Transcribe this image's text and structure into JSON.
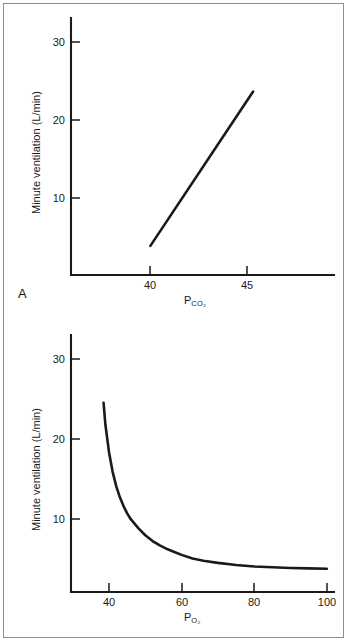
{
  "figure": {
    "background_color": "#ffffff",
    "border_color": "#8d8d8d",
    "ink_color": "#1a1a1a"
  },
  "panels": [
    {
      "letter": "A",
      "ylabel": "Minute ventilation (L/min)",
      "xlabel_main": "P",
      "xlabel_sub": "CO2",
      "xlabel_sub_display": "CO₂"
    },
    {
      "letter": "B",
      "ylabel": "Minute ventilation (L/min)",
      "xlabel_main": "P",
      "xlabel_sub": "O2",
      "xlabel_sub_display": "O₂"
    }
  ],
  "chart_data": [
    {
      "type": "line",
      "title": "",
      "panel": "A",
      "xlabel": "PCO2",
      "ylabel": "Minute ventilation (L/min)",
      "xlim": [
        37.0,
        47.5
      ],
      "ylim": [
        0,
        32
      ],
      "xticks": [
        40,
        45
      ],
      "xtick_labels": [
        "40",
        "45"
      ],
      "yticks": [
        10,
        20,
        30
      ],
      "ytick_labels": [
        "10",
        "20",
        "30"
      ],
      "grid": false,
      "legend": "none",
      "series": [
        {
          "name": "CO2 ventilatory response",
          "x": [
            40.0,
            45.3
          ],
          "values": [
            4.0,
            25.2
          ]
        }
      ]
    },
    {
      "type": "line",
      "title": "",
      "panel": "B",
      "xlabel": "PO2",
      "ylabel": "Minute ventilation (L/min)",
      "xlim": [
        30,
        102
      ],
      "ylim": [
        0,
        32
      ],
      "xticks": [
        40,
        60,
        80,
        100
      ],
      "xtick_labels": [
        "40",
        "60",
        "80",
        "100"
      ],
      "yticks": [
        10,
        20,
        30
      ],
      "ytick_labels": [
        "10",
        "20",
        "30"
      ],
      "grid": false,
      "legend": "none",
      "series": [
        {
          "name": "O2 ventilatory response",
          "x": [
            38.5,
            39,
            40,
            41,
            42,
            43,
            44,
            45,
            46,
            48,
            50,
            52,
            54,
            56,
            58,
            60,
            63,
            66,
            70,
            75,
            80,
            85,
            90,
            95,
            100
          ],
          "values": [
            26.0,
            23.0,
            19.2,
            16.5,
            14.5,
            13.0,
            11.8,
            10.8,
            10.0,
            8.8,
            7.8,
            7.0,
            6.4,
            5.9,
            5.5,
            5.1,
            4.6,
            4.3,
            4.0,
            3.7,
            3.5,
            3.4,
            3.3,
            3.25,
            3.2
          ]
        }
      ]
    }
  ]
}
